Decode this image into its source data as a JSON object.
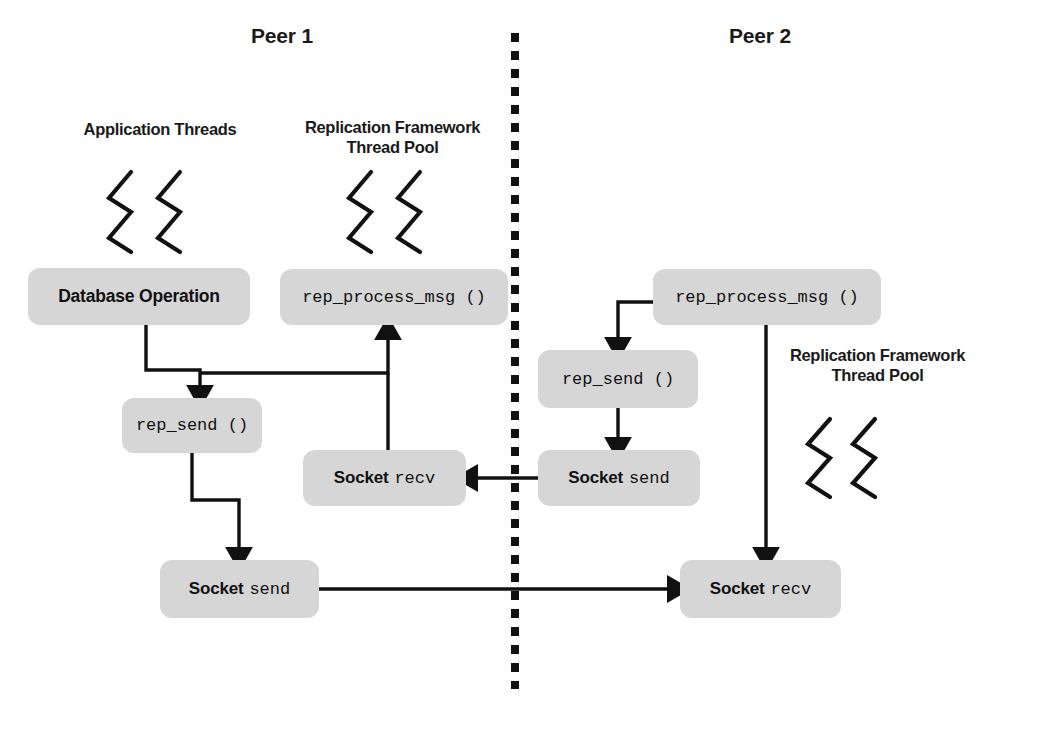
{
  "diagram": {
    "title_left": "Peer 1",
    "title_right": "Peer 2",
    "divider": "vertical-dashed-divider",
    "colors": {
      "node_fill": "#d6d6d6",
      "stroke": "#111111",
      "text": "#1a1a1a",
      "background": "#ffffff"
    }
  },
  "peer1": {
    "title": "Peer 1",
    "labels": {
      "app_threads": "Application Threads",
      "pool_line1": "Replication Framework",
      "pool_line2": "Thread Pool"
    },
    "nodes": {
      "database_operation": "Database Operation",
      "rep_process_msg": "rep_process_msg ()",
      "rep_send": "rep_send ()",
      "socket_recv_word": "Socket",
      "socket_recv_call": "recv",
      "socket_send_word": "Socket",
      "socket_send_call": "send"
    },
    "thread_glyphs": [
      "zigzag-thread",
      "zigzag-thread",
      "zigzag-thread",
      "zigzag-thread"
    ]
  },
  "peer2": {
    "title": "Peer 2",
    "labels": {
      "pool_line1": "Replication Framework",
      "pool_line2": "Thread Pool"
    },
    "nodes": {
      "rep_process_msg": "rep_process_msg ()",
      "rep_send": "rep_send ()",
      "socket_send_word": "Socket",
      "socket_send_call": "send",
      "socket_recv_word": "Socket",
      "socket_recv_call": "recv"
    },
    "thread_glyphs": [
      "zigzag-thread",
      "zigzag-thread"
    ]
  },
  "flows": [
    {
      "from": "peer1.database_operation",
      "to": "peer1.rep_send"
    },
    {
      "from": "peer1.socket_recv",
      "to": "peer1.rep_process_msg"
    },
    {
      "from": "peer1.rep_send",
      "to": "peer1.socket_send"
    },
    {
      "from": "peer1.socket_send",
      "to": "peer2.socket_recv"
    },
    {
      "from": "peer2.rep_process_msg",
      "to": "peer2.rep_send"
    },
    {
      "from": "peer2.rep_process_msg",
      "to": "peer2.socket_recv"
    },
    {
      "from": "peer2.rep_send",
      "to": "peer2.socket_send"
    },
    {
      "from": "peer2.socket_send",
      "to": "peer1.socket_recv"
    }
  ]
}
